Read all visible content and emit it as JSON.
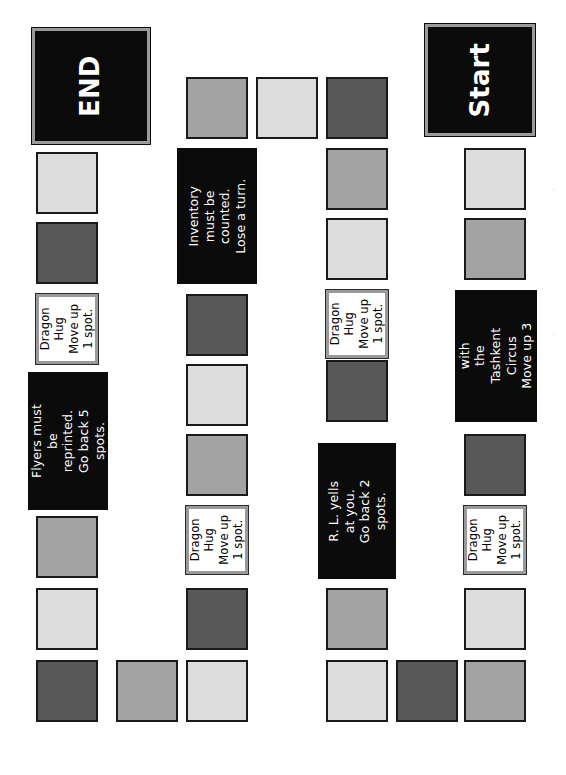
{
  "board": {
    "title_start": "Start",
    "title_end": "END",
    "orientation": "rotated-90-ccw",
    "colors": {
      "light": "#dcdcdc",
      "medium": "#a3a3a3",
      "dark": "#585858",
      "black_card": "#0b0b0b",
      "white_card": "#ffffff",
      "border": "#1a1a1a",
      "frame": "#9a9a9a",
      "page": "#ffffff"
    },
    "tiles": [
      {
        "id": "t01",
        "kind": "terminal-black",
        "label": "Start",
        "x": 425,
        "y": 24,
        "w": 110,
        "h": 112
      },
      {
        "id": "t02",
        "kind": "square",
        "shade": "light",
        "x": 464,
        "y": 148,
        "w": 62,
        "h": 62
      },
      {
        "id": "t03",
        "kind": "square",
        "shade": "medium",
        "x": 464,
        "y": 218,
        "w": 62,
        "h": 62
      },
      {
        "id": "t04",
        "kind": "card-black",
        "label": "Make a deal with\nthe Tashkent\nCircus\nMove up 3 spots.",
        "x": 455,
        "y": 290,
        "w": 82,
        "h": 132
      },
      {
        "id": "t05",
        "kind": "square",
        "shade": "dark",
        "x": 464,
        "y": 434,
        "w": 62,
        "h": 62
      },
      {
        "id": "t06",
        "kind": "card-white",
        "label": "Dragon\nHug\nMove up\n1 spot.",
        "x": 464,
        "y": 506,
        "w": 62,
        "h": 68
      },
      {
        "id": "t07",
        "kind": "square",
        "shade": "light",
        "x": 464,
        "y": 588,
        "w": 62,
        "h": 62
      },
      {
        "id": "t08",
        "kind": "square",
        "shade": "medium",
        "x": 464,
        "y": 660,
        "w": 62,
        "h": 62
      },
      {
        "id": "t09",
        "kind": "square",
        "shade": "dark",
        "x": 396,
        "y": 660,
        "w": 62,
        "h": 62
      },
      {
        "id": "t10",
        "kind": "square",
        "shade": "light",
        "x": 326,
        "y": 660,
        "w": 62,
        "h": 62
      },
      {
        "id": "t11",
        "kind": "square",
        "shade": "medium",
        "x": 326,
        "y": 588,
        "w": 62,
        "h": 62
      },
      {
        "id": "t12",
        "kind": "card-black",
        "label": "R. L. yells at you.\nGo back 2 spots.",
        "x": 318,
        "y": 443,
        "w": 78,
        "h": 136
      },
      {
        "id": "t13",
        "kind": "square",
        "shade": "dark",
        "x": 326,
        "y": 360,
        "w": 62,
        "h": 62
      },
      {
        "id": "t14",
        "kind": "card-white",
        "label": "Dragon\nHug\nMove up\n1 spot.",
        "x": 326,
        "y": 290,
        "w": 62,
        "h": 68
      },
      {
        "id": "t15",
        "kind": "square",
        "shade": "light",
        "x": 326,
        "y": 218,
        "w": 62,
        "h": 62
      },
      {
        "id": "t16",
        "kind": "square",
        "shade": "medium",
        "x": 326,
        "y": 148,
        "w": 62,
        "h": 62
      },
      {
        "id": "t17",
        "kind": "square",
        "shade": "dark",
        "x": 326,
        "y": 77,
        "w": 62,
        "h": 62
      },
      {
        "id": "t18",
        "kind": "square",
        "shade": "light",
        "x": 256,
        "y": 77,
        "w": 62,
        "h": 62
      },
      {
        "id": "t19",
        "kind": "square",
        "shade": "medium",
        "x": 186,
        "y": 77,
        "w": 62,
        "h": 62
      },
      {
        "id": "t20",
        "kind": "card-black",
        "label": "Inventory must be\ncounted.\nLose a turn.",
        "x": 177,
        "y": 148,
        "w": 80,
        "h": 136
      },
      {
        "id": "t21",
        "kind": "square",
        "shade": "dark",
        "x": 186,
        "y": 294,
        "w": 62,
        "h": 62
      },
      {
        "id": "t22",
        "kind": "square",
        "shade": "light",
        "x": 186,
        "y": 364,
        "w": 62,
        "h": 62
      },
      {
        "id": "t23",
        "kind": "square",
        "shade": "medium",
        "x": 186,
        "y": 434,
        "w": 62,
        "h": 62
      },
      {
        "id": "t24",
        "kind": "card-white",
        "label": "Dragon\nHug\nMove up\n1 spot.",
        "x": 186,
        "y": 506,
        "w": 62,
        "h": 68
      },
      {
        "id": "t25",
        "kind": "square",
        "shade": "dark",
        "x": 186,
        "y": 588,
        "w": 62,
        "h": 62
      },
      {
        "id": "t26",
        "kind": "square",
        "shade": "light",
        "x": 186,
        "y": 660,
        "w": 62,
        "h": 62
      },
      {
        "id": "t27",
        "kind": "square",
        "shade": "medium",
        "x": 116,
        "y": 660,
        "w": 62,
        "h": 62
      },
      {
        "id": "t28",
        "kind": "square",
        "shade": "dark",
        "x": 36,
        "y": 660,
        "w": 62,
        "h": 62
      },
      {
        "id": "t29",
        "kind": "square",
        "shade": "light",
        "x": 36,
        "y": 588,
        "w": 62,
        "h": 62
      },
      {
        "id": "t30",
        "kind": "square",
        "shade": "medium",
        "x": 36,
        "y": 516,
        "w": 62,
        "h": 62
      },
      {
        "id": "t31",
        "kind": "card-black",
        "label": "Flyers must be\nreprinted.\nGo back 5 spots.",
        "x": 28,
        "y": 372,
        "w": 80,
        "h": 138
      },
      {
        "id": "t32",
        "kind": "card-white",
        "label": "Dragon\nHug\nMove up\n1 spot.",
        "x": 36,
        "y": 294,
        "w": 62,
        "h": 70
      },
      {
        "id": "t33",
        "kind": "square",
        "shade": "dark",
        "x": 36,
        "y": 222,
        "w": 62,
        "h": 62
      },
      {
        "id": "t34",
        "kind": "square",
        "shade": "light",
        "x": 36,
        "y": 152,
        "w": 62,
        "h": 62
      },
      {
        "id": "t35",
        "kind": "terminal-black",
        "label": "END",
        "x": 32,
        "y": 28,
        "w": 118,
        "h": 116
      }
    ],
    "stray_marks": [
      {
        "id": "m1",
        "text": "·",
        "x": 552,
        "y": 185
      },
      {
        "id": "m2",
        "text": "·",
        "x": 552,
        "y": 330
      }
    ]
  }
}
